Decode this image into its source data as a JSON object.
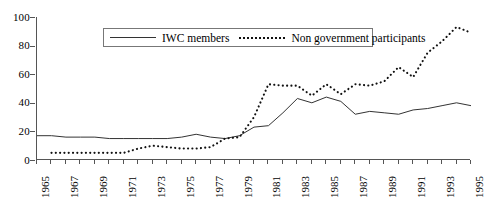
{
  "chart_data": {
    "type": "line",
    "title": "",
    "xlabel": "",
    "ylabel": "",
    "xlim": [
      1965,
      1995
    ],
    "ylim": [
      0,
      100
    ],
    "grid": false,
    "legend_position": "top-center-inside",
    "y_ticks": [
      0,
      20,
      40,
      60,
      80,
      100
    ],
    "x_ticks_labeled": [
      1965,
      1967,
      1969,
      1971,
      1973,
      1975,
      1977,
      1979,
      1981,
      1983,
      1985,
      1987,
      1989,
      1991,
      1993,
      1995
    ],
    "x": [
      1965,
      1966,
      1967,
      1968,
      1969,
      1970,
      1971,
      1972,
      1973,
      1974,
      1975,
      1976,
      1977,
      1978,
      1979,
      1980,
      1981,
      1982,
      1983,
      1984,
      1985,
      1986,
      1987,
      1988,
      1989,
      1990,
      1991,
      1992,
      1993,
      1994,
      1995
    ],
    "series": [
      {
        "name": "IWC members",
        "style": "solid",
        "color": "#333333",
        "values": [
          17,
          17,
          16,
          16,
          16,
          15,
          15,
          15,
          15,
          15,
          16,
          18,
          16,
          15,
          17,
          23,
          24,
          33,
          43,
          40,
          44,
          41,
          32,
          34,
          33,
          32,
          35,
          36,
          38,
          40,
          38
        ]
      },
      {
        "name": "Non government participants",
        "style": "dotted",
        "color": "#111111",
        "values": [
          null,
          5,
          5,
          5,
          5,
          5,
          5,
          8,
          10,
          9,
          8,
          8,
          9,
          15,
          16,
          30,
          53,
          52,
          52,
          45,
          53,
          46,
          53,
          52,
          55,
          65,
          58,
          75,
          83,
          93,
          89
        ]
      }
    ]
  },
  "legend": {
    "series_1_label": "IWC members",
    "series_2_label": "Non government participants"
  },
  "axes": {
    "y_labels": [
      "100",
      "80",
      "60",
      "40",
      "20",
      "0"
    ],
    "x_labels": [
      "1965",
      "1967",
      "1969",
      "1971",
      "1973",
      "1975",
      "1977",
      "1979",
      "1981",
      "1983",
      "1985",
      "1987",
      "1989",
      "1991",
      "1993",
      "1995"
    ]
  },
  "title_strip": ""
}
